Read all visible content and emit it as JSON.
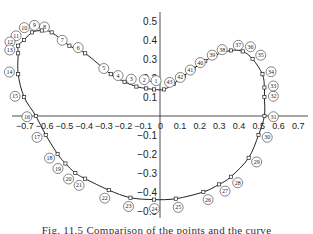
{
  "figure": {
    "caption": "Fig. 11.5  Comparison of the points and the curve",
    "x_axis": {
      "ticks": [
        "-0.7",
        "-0.6",
        "-0.5",
        "-0.4",
        "-0.3",
        "-0.2",
        "-0.1",
        "0",
        "0.1",
        "0.2",
        "0.3",
        "0.4",
        "0.5",
        "0.6",
        "0.7"
      ]
    },
    "y_axis": {
      "ticks": [
        "0.5",
        "0.4",
        "0.3",
        "0.2",
        "0.1",
        "-0.1",
        "-0.2",
        "-0.3",
        "-0.4",
        "-0.5"
      ]
    },
    "points": [
      {
        "n": "1",
        "x": -0.03,
        "y": 0.14
      },
      {
        "n": "2",
        "x": -0.07,
        "y": 0.145
      },
      {
        "n": "3",
        "x": -0.12,
        "y": 0.155
      },
      {
        "n": "4",
        "x": -0.18,
        "y": 0.18
      },
      {
        "n": "5",
        "x": -0.25,
        "y": 0.22
      },
      {
        "n": "6",
        "x": -0.38,
        "y": 0.33
      },
      {
        "n": "7",
        "x": -0.46,
        "y": 0.37
      },
      {
        "n": "8",
        "x": -0.55,
        "y": 0.44
      },
      {
        "n": "9",
        "x": -0.6,
        "y": 0.45
      },
      {
        "n": "10",
        "x": -0.65,
        "y": 0.44
      },
      {
        "n": "11",
        "x": -0.69,
        "y": 0.4
      },
      {
        "n": "12",
        "x": -0.72,
        "y": 0.37
      },
      {
        "n": "13",
        "x": -0.72,
        "y": 0.33
      },
      {
        "n": "14",
        "x": -0.72,
        "y": 0.22
      },
      {
        "n": "15",
        "x": -0.69,
        "y": 0.1
      },
      {
        "n": "16",
        "x": -0.63,
        "y": 0.0
      },
      {
        "n": "17",
        "x": -0.58,
        "y": -0.1
      },
      {
        "n": "18",
        "x": -0.52,
        "y": -0.2
      },
      {
        "n": "19",
        "x": -0.48,
        "y": -0.25
      },
      {
        "n": "20",
        "x": -0.43,
        "y": -0.3
      },
      {
        "n": "21",
        "x": -0.38,
        "y": -0.33
      },
      {
        "n": "22",
        "x": -0.26,
        "y": -0.39
      },
      {
        "n": "23",
        "x": -0.15,
        "y": -0.43
      },
      {
        "n": "24",
        "x": -0.03,
        "y": -0.44
      },
      {
        "n": "25",
        "x": 0.08,
        "y": -0.435
      },
      {
        "n": "26",
        "x": 0.22,
        "y": -0.4
      },
      {
        "n": "27",
        "x": 0.3,
        "y": -0.36
      },
      {
        "n": "28",
        "x": 0.36,
        "y": -0.32
      },
      {
        "n": "29",
        "x": 0.45,
        "y": -0.22
      },
      {
        "n": "30",
        "x": 0.5,
        "y": -0.1
      },
      {
        "n": "31",
        "x": 0.53,
        "y": 0.0
      },
      {
        "n": "32",
        "x": 0.53,
        "y": 0.1
      },
      {
        "n": "33",
        "x": 0.53,
        "y": 0.15
      },
      {
        "n": "34",
        "x": 0.52,
        "y": 0.22
      },
      {
        "n": "35",
        "x": 0.47,
        "y": 0.3
      },
      {
        "n": "36",
        "x": 0.42,
        "y": 0.34
      },
      {
        "n": "37",
        "x": 0.36,
        "y": 0.345
      },
      {
        "n": "38",
        "x": 0.28,
        "y": 0.32
      },
      {
        "n": "39",
        "x": 0.23,
        "y": 0.29
      },
      {
        "n": "40",
        "x": 0.17,
        "y": 0.25
      },
      {
        "n": "41",
        "x": 0.12,
        "y": 0.21
      },
      {
        "n": "42",
        "x": 0.07,
        "y": 0.17
      },
      {
        "n": "43",
        "x": 0.02,
        "y": 0.14
      }
    ]
  }
}
